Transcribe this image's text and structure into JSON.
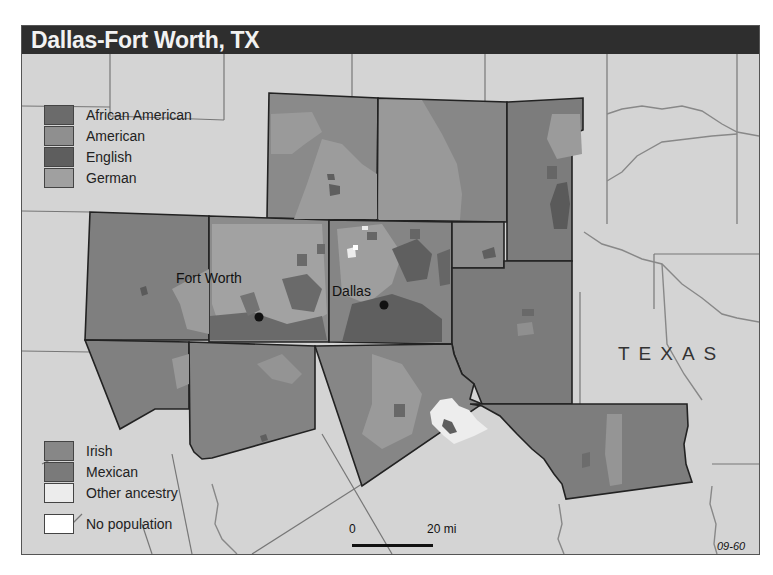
{
  "title": "Dallas-Fort Worth, TX",
  "legend_top": [
    {
      "label": "African American",
      "color": "#6b6b6b"
    },
    {
      "label": "American",
      "color": "#8f8f8f"
    },
    {
      "label": "English",
      "color": "#5e5e5e"
    },
    {
      "label": "German",
      "color": "#a0a0a0"
    }
  ],
  "legend_bottom": [
    {
      "label": "Irish",
      "color": "#878787"
    },
    {
      "label": "Mexican",
      "color": "#7a7a7a"
    },
    {
      "label": "Other ancestry",
      "color": "#ececec"
    },
    {
      "label": "No population",
      "color": "#ffffff"
    }
  ],
  "cities": [
    {
      "name": "Fort Worth"
    },
    {
      "name": "Dallas"
    }
  ],
  "state_label": "TEXAS",
  "scale": {
    "start": "0",
    "end": "20 mi"
  },
  "map_id": "09-60",
  "colors": {
    "background": "#d4d4d4",
    "title_bar": "#2e2e2e",
    "county_base": "#7e7e7e"
  }
}
